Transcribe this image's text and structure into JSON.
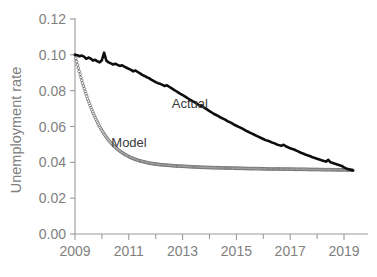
{
  "chart_data": {
    "type": "line",
    "title": "",
    "xlabel": "",
    "ylabel": "Unemployment rate",
    "xlim": [
      2009.0,
      2019.4
    ],
    "ylim": [
      0.0,
      0.12
    ],
    "grid": false,
    "legend_position": "inline-annotations",
    "yticks": [
      "0.00",
      "0.02",
      "0.04",
      "0.06",
      "0.08",
      "0.10",
      "0.12"
    ],
    "ytick_values": [
      0.0,
      0.02,
      0.04,
      0.06,
      0.08,
      0.1,
      0.12
    ],
    "xticks": [
      "2009",
      "2011",
      "2013",
      "2015",
      "2017",
      "2019"
    ],
    "xtick_values": [
      2009,
      2011,
      2013,
      2015,
      2017,
      2019
    ],
    "xminor_ticks": [
      2010,
      2012,
      2014,
      2016,
      2018
    ],
    "annotations": [
      {
        "text": "Actual",
        "x": 2012.6,
        "y": 0.0705
      },
      {
        "text": "Model",
        "x": 2010.35,
        "y": 0.0485
      }
    ],
    "series": [
      {
        "name": "Actual",
        "style": "thick-solid-black",
        "color": "#0d0d0d",
        "x": [
          2009.0,
          2009.083,
          2009.167,
          2009.25,
          2009.333,
          2009.417,
          2009.5,
          2009.583,
          2009.667,
          2009.75,
          2009.833,
          2009.917,
          2010.0,
          2010.083,
          2010.167,
          2010.25,
          2010.333,
          2010.417,
          2010.5,
          2010.583,
          2010.667,
          2010.75,
          2010.833,
          2010.917,
          2011.0,
          2011.083,
          2011.167,
          2011.25,
          2011.333,
          2011.417,
          2011.5,
          2011.583,
          2011.667,
          2011.75,
          2011.833,
          2011.917,
          2012.0,
          2012.083,
          2012.167,
          2012.25,
          2012.333,
          2012.417,
          2012.5,
          2012.583,
          2012.667,
          2012.75,
          2012.833,
          2012.917,
          2013.0,
          2013.083,
          2013.167,
          2013.25,
          2013.333,
          2013.417,
          2013.5,
          2013.583,
          2013.667,
          2013.75,
          2013.833,
          2013.917,
          2014.0,
          2014.083,
          2014.167,
          2014.25,
          2014.333,
          2014.417,
          2014.5,
          2014.583,
          2014.667,
          2014.75,
          2014.833,
          2014.917,
          2015.0,
          2015.083,
          2015.167,
          2015.25,
          2015.333,
          2015.417,
          2015.5,
          2015.583,
          2015.667,
          2015.75,
          2015.833,
          2015.917,
          2016.0,
          2016.083,
          2016.167,
          2016.25,
          2016.333,
          2016.417,
          2016.5,
          2016.583,
          2016.667,
          2016.75,
          2016.833,
          2016.917,
          2017.0,
          2017.083,
          2017.167,
          2017.25,
          2017.333,
          2017.417,
          2017.5,
          2017.583,
          2017.667,
          2017.75,
          2017.833,
          2017.917,
          2018.0,
          2018.083,
          2018.167,
          2018.25,
          2018.333,
          2018.417,
          2018.5,
          2018.583,
          2018.667,
          2018.75,
          2018.833,
          2018.917,
          2019.0,
          2019.083,
          2019.167,
          2019.25,
          2019.333
        ],
        "y": [
          0.1,
          0.0998,
          0.0992,
          0.0996,
          0.099,
          0.0978,
          0.0985,
          0.0979,
          0.0968,
          0.0972,
          0.0964,
          0.0958,
          0.097,
          0.1012,
          0.0967,
          0.0958,
          0.0952,
          0.0946,
          0.095,
          0.0944,
          0.0938,
          0.0942,
          0.0934,
          0.0928,
          0.0922,
          0.0916,
          0.0908,
          0.0912,
          0.0904,
          0.0896,
          0.0888,
          0.0882,
          0.0875,
          0.087,
          0.0862,
          0.0855,
          0.0848,
          0.0842,
          0.0838,
          0.0832,
          0.0826,
          0.083,
          0.0822,
          0.0814,
          0.0806,
          0.0798,
          0.079,
          0.0782,
          0.0776,
          0.0768,
          0.076,
          0.0752,
          0.0745,
          0.0738,
          0.073,
          0.0722,
          0.0716,
          0.071,
          0.0702,
          0.0694,
          0.0686,
          0.0678,
          0.067,
          0.0664,
          0.0658,
          0.065,
          0.0644,
          0.0638,
          0.063,
          0.0624,
          0.0618,
          0.061,
          0.0604,
          0.0598,
          0.0592,
          0.0586,
          0.0578,
          0.0572,
          0.0566,
          0.056,
          0.0554,
          0.0548,
          0.0542,
          0.0536,
          0.053,
          0.0524,
          0.052,
          0.0516,
          0.051,
          0.0506,
          0.05,
          0.0496,
          0.0492,
          0.0498,
          0.049,
          0.0484,
          0.0478,
          0.0474,
          0.047,
          0.0464,
          0.0458,
          0.0452,
          0.0448,
          0.0442,
          0.0438,
          0.0434,
          0.0428,
          0.0424,
          0.042,
          0.0416,
          0.0412,
          0.0408,
          0.0404,
          0.0414,
          0.04,
          0.0396,
          0.0392,
          0.0388,
          0.0384,
          0.038,
          0.0372,
          0.0366,
          0.0362,
          0.0358,
          0.0355
        ]
      },
      {
        "name": "Model",
        "style": "thin-line-with-open-circle-markers",
        "color": "#3d3d3d",
        "x": [
          2009.0,
          2009.083,
          2009.167,
          2009.25,
          2009.333,
          2009.417,
          2009.5,
          2009.583,
          2009.667,
          2009.75,
          2009.833,
          2009.917,
          2010.0,
          2010.083,
          2010.167,
          2010.25,
          2010.333,
          2010.417,
          2010.5,
          2010.583,
          2010.667,
          2010.75,
          2010.833,
          2010.917,
          2011.0,
          2011.083,
          2011.167,
          2011.25,
          2011.333,
          2011.417,
          2011.5,
          2011.583,
          2011.667,
          2011.75,
          2011.833,
          2011.917,
          2012.0,
          2012.25,
          2012.5,
          2012.75,
          2013.0,
          2013.25,
          2013.5,
          2013.75,
          2014.0,
          2014.25,
          2014.5,
          2014.75,
          2015.0,
          2015.25,
          2015.5,
          2015.75,
          2016.0,
          2016.25,
          2016.5,
          2016.75,
          2017.0,
          2017.25,
          2017.5,
          2017.75,
          2018.0,
          2018.25,
          2018.5,
          2018.75,
          2019.0,
          2019.167,
          2019.333
        ],
        "y": [
          0.1,
          0.095,
          0.0902,
          0.0858,
          0.0816,
          0.0778,
          0.0742,
          0.0709,
          0.0678,
          0.065,
          0.0624,
          0.06,
          0.0578,
          0.0558,
          0.054,
          0.0524,
          0.0509,
          0.0496,
          0.0484,
          0.0473,
          0.0463,
          0.0454,
          0.0446,
          0.0439,
          0.0432,
          0.0426,
          0.0421,
          0.0416,
          0.0412,
          0.0408,
          0.0405,
          0.0402,
          0.0399,
          0.0396,
          0.0394,
          0.0392,
          0.039,
          0.0386,
          0.0383,
          0.038,
          0.0378,
          0.0376,
          0.0374,
          0.0372,
          0.0371,
          0.037,
          0.0369,
          0.0368,
          0.0367,
          0.0366,
          0.0365,
          0.0365,
          0.0364,
          0.0363,
          0.0363,
          0.0362,
          0.0362,
          0.0361,
          0.0361,
          0.036,
          0.036,
          0.0359,
          0.0359,
          0.0358,
          0.0358,
          0.0357,
          0.0356
        ]
      }
    ]
  },
  "axes": {
    "y_axis_title": "Unemployment rate"
  }
}
